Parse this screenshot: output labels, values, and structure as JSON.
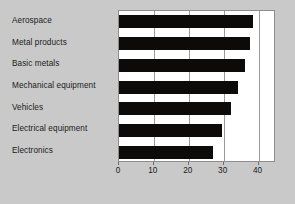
{
  "chart_data": {
    "type": "bar",
    "orientation": "horizontal",
    "title": "",
    "xlabel": "",
    "ylabel": "",
    "categories": [
      "Aerospace",
      "Metal products",
      "Basic metals",
      "Mechanical equipment",
      "Vehicles",
      "Electrical equipment",
      "Electronics"
    ],
    "values": [
      38.5,
      37.5,
      36,
      34,
      32,
      29.5,
      27
    ],
    "xlim": [
      0,
      45
    ],
    "xticks": [
      0,
      10,
      20,
      30,
      40
    ],
    "xtick_labels": [
      "0",
      "10",
      "20",
      "30",
      "40"
    ],
    "grid": "vertical",
    "legend": "none",
    "bar_color": "#0d0a0a",
    "plot_background": "#ffffff",
    "figure_background": "#c9c9c9",
    "gridline_color": "#9a9a9a"
  }
}
